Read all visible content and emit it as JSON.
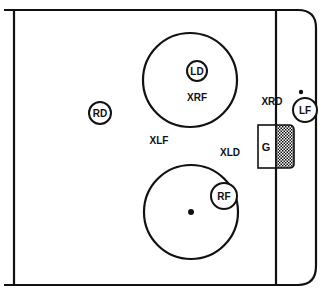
{
  "diagram": {
    "colors": {
      "line": "#111111",
      "background": "#ffffff"
    },
    "players": [
      {
        "id": "LD",
        "label": "LD",
        "cx": 197,
        "cy": 71,
        "r": 10
      },
      {
        "id": "RD",
        "label": "RD",
        "cx": 100,
        "cy": 113,
        "r": 11
      },
      {
        "id": "LF",
        "label": "LF",
        "cx": 305,
        "cy": 110,
        "r": 12
      },
      {
        "id": "RF",
        "label": "RF",
        "cx": 224,
        "cy": 196,
        "r": 13
      }
    ],
    "markers": [
      {
        "label": "XRF",
        "x": 197,
        "y": 101
      },
      {
        "label": "XRD",
        "x": 272,
        "y": 105
      },
      {
        "label": "XLF",
        "x": 159,
        "y": 144
      },
      {
        "label": "XLD",
        "x": 230,
        "y": 156
      }
    ],
    "goalie": {
      "label": "G"
    }
  }
}
